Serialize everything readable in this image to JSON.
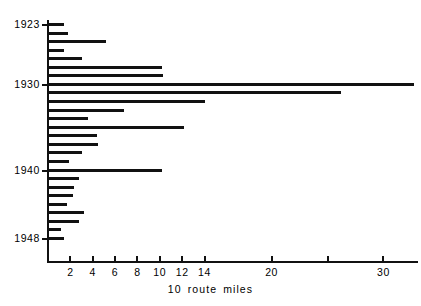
{
  "chart_data": {
    "type": "bar",
    "orientation": "horizontal",
    "title": "",
    "xlabel": "10 route miles",
    "ylabel": "",
    "xlim": [
      0,
      33.5
    ],
    "ylim_categories": [
      "1923",
      "1948"
    ],
    "grid": false,
    "legend": null,
    "x_ticks": [
      {
        "value": 2,
        "label": "2"
      },
      {
        "value": 4,
        "label": "4"
      },
      {
        "value": 6,
        "label": "6"
      },
      {
        "value": 8,
        "label": "8"
      },
      {
        "value": 10,
        "label": "10"
      },
      {
        "value": 12,
        "label": "12"
      },
      {
        "value": 14,
        "label": "14"
      },
      {
        "value": 20,
        "label": "20"
      },
      {
        "value": 25,
        "label": ""
      },
      {
        "value": 30,
        "label": "30"
      }
    ],
    "y_ticks": [
      {
        "category": "1923",
        "label": "1923"
      },
      {
        "category": "1930",
        "label": "1930"
      },
      {
        "category": "1940",
        "label": "1940"
      },
      {
        "category": "1948",
        "label": "1948"
      }
    ],
    "categories": [
      "1923",
      "1924",
      "1925",
      "1926",
      "1927",
      "1928",
      "1929",
      "1930",
      "1931",
      "1932",
      "1933",
      "1934",
      "1935",
      "1936",
      "1937",
      "1938",
      "1939",
      "1940",
      "1941",
      "1942",
      "1943",
      "1944",
      "1945",
      "1946",
      "1947",
      "1948"
    ],
    "values": [
      1.4,
      1.8,
      5.2,
      1.4,
      3.0,
      10.2,
      10.3,
      32.7,
      26.2,
      14.0,
      6.8,
      3.6,
      12.2,
      4.4,
      4.5,
      3.0,
      1.9,
      10.2,
      2.8,
      2.3,
      2.2,
      1.7,
      3.2,
      2.8,
      1.2,
      1.4
    ],
    "values_label": "route miles (tens)"
  }
}
